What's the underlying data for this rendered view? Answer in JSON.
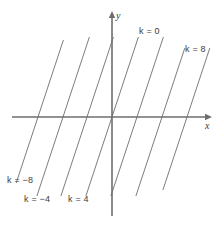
{
  "figure": {
    "width": 219,
    "height": 227,
    "background": "#ffffff"
  },
  "axes": {
    "x_axis": {
      "label": "x",
      "color": "#6e6e6e",
      "y_pixel": 117,
      "x_start": 12,
      "x_end": 212,
      "label_x": 205,
      "label_y": 121
    },
    "y_axis": {
      "label": "y",
      "color": "#6e6e6e",
      "x_pixel": 112,
      "y_start": 11,
      "y_end": 216,
      "label_x": 116,
      "label_y": 11
    },
    "origin": {
      "x": 112,
      "y": 117
    }
  },
  "chart_data": {
    "type": "line",
    "title": "",
    "subtitle": "",
    "xlabel": "x",
    "ylabel": "y",
    "grid": false,
    "legend_position": "inline-annotations",
    "line_color": "#7c7c7c",
    "slope_screen_dx_per_dy": -0.33,
    "contour_spacing_px": 25,
    "x_axis_range": [
      -4,
      4
    ],
    "y_axis_range": [
      -4,
      4
    ],
    "contours": [
      {
        "k": -8,
        "label": "k = −8",
        "x_intercept_px": 38,
        "labelled": true,
        "label_x": 7,
        "label_y": 176
      },
      {
        "k": -6,
        "label": "",
        "x_intercept_px": 63,
        "labelled": false,
        "label_x": 0,
        "label_y": 0
      },
      {
        "k": -4,
        "label": "k = −4",
        "x_intercept_px": 87,
        "labelled": true,
        "label_x": 24,
        "label_y": 195
      },
      {
        "k": 0,
        "label": "k = 0",
        "x_intercept_px": 112,
        "labelled": true,
        "label_x": 139,
        "label_y": 27
      },
      {
        "k": 4,
        "label": "k = 4",
        "x_intercept_px": 137,
        "labelled": true,
        "label_x": 68,
        "label_y": 195
      },
      {
        "k": 6,
        "label": "",
        "x_intercept_px": 162,
        "labelled": false,
        "label_x": 0,
        "label_y": 0
      },
      {
        "k": 8,
        "label": "k = 8",
        "x_intercept_px": 187,
        "labelled": true,
        "label_x": 185,
        "label_y": 45
      }
    ],
    "labels": [
      "k = −8",
      "k = −4",
      "k = 4",
      "k = 0",
      "k = 8"
    ]
  }
}
